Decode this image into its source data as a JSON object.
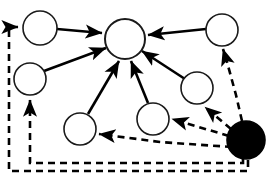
{
  "diagram": {
    "canvas": {
      "width": 268,
      "height": 177,
      "background": "#ffffff"
    },
    "style": {
      "node_stroke_color": "#000000",
      "node_fill_color": "#ffffff",
      "hub_fill_pattern": "diagonal-hatch",
      "filled_node_color": "#000000",
      "solid_edge_color": "#000000",
      "dashed_edge_color": "#000000",
      "dash_pattern": "7 5"
    },
    "nodes": [
      {
        "id": "n1",
        "label": "",
        "kind": "plain",
        "cx": 40,
        "cy": 28,
        "r": 17
      },
      {
        "id": "n2",
        "label": "",
        "kind": "plain",
        "cx": 30,
        "cy": 79,
        "r": 16
      },
      {
        "id": "hub",
        "label": "",
        "kind": "hatched",
        "cx": 125,
        "cy": 39,
        "r": 20
      },
      {
        "id": "n3",
        "label": "",
        "kind": "plain",
        "cx": 80,
        "cy": 129,
        "r": 16
      },
      {
        "id": "n4",
        "label": "",
        "kind": "plain",
        "cx": 153,
        "cy": 119,
        "r": 16
      },
      {
        "id": "n5",
        "label": "",
        "kind": "plain",
        "cx": 197,
        "cy": 88,
        "r": 16
      },
      {
        "id": "n6",
        "label": "",
        "kind": "plain",
        "cx": 222,
        "cy": 30,
        "r": 16
      },
      {
        "id": "n7",
        "label": "",
        "kind": "filled",
        "cx": 246,
        "cy": 140,
        "r": 19
      }
    ],
    "solid_edges": [
      {
        "from": "n1",
        "to": "hub"
      },
      {
        "from": "n2",
        "to": "hub"
      },
      {
        "from": "n3",
        "to": "hub"
      },
      {
        "from": "n4",
        "to": "hub"
      },
      {
        "from": "n5",
        "to": "hub"
      },
      {
        "from": "n6",
        "to": "hub"
      }
    ],
    "dashed_edges": [
      {
        "from": "n7",
        "to": "n3",
        "routing": "direct-left"
      },
      {
        "from": "n7",
        "to": "n4",
        "routing": "direct-left"
      },
      {
        "from": "n7",
        "to": "n5",
        "routing": "up-left-curve"
      },
      {
        "from": "n7",
        "to": "n6",
        "routing": "right-vertical"
      },
      {
        "from": "n7",
        "to": "n2",
        "routing": "bottom-border-inner"
      },
      {
        "from": "n7",
        "to": "n1",
        "routing": "bottom-border-outer"
      }
    ],
    "counts": {
      "total_nodes": 8,
      "plain_nodes": 6,
      "hatched_nodes": 1,
      "filled_nodes": 1,
      "solid_edges": 6,
      "dashed_edges": 6
    }
  }
}
